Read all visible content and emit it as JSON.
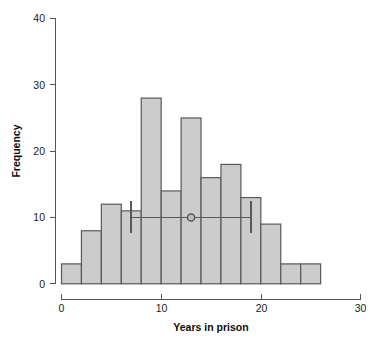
{
  "chart_data": {
    "type": "bar",
    "title": "",
    "subtitle": "",
    "xlabel": "Years in prison",
    "ylabel": "Frequency",
    "xlim": [
      0,
      30
    ],
    "ylim": [
      0,
      40
    ],
    "xticks": [
      0,
      10,
      20,
      30
    ],
    "xtick_labels": [
      "0",
      "10",
      "20",
      "30"
    ],
    "yticks": [
      0,
      10,
      20,
      30,
      40
    ],
    "ytick_labels": [
      "0",
      "10",
      "20",
      "30",
      "40"
    ],
    "grid": false,
    "legend": "none",
    "bin_width": 2,
    "bin_edges": [
      0,
      2,
      4,
      6,
      8,
      10,
      12,
      14,
      16,
      18,
      20,
      22,
      24,
      26
    ],
    "categories": [
      "0-2",
      "2-4",
      "4-6",
      "6-8",
      "8-10",
      "10-12",
      "12-14",
      "14-16",
      "16-18",
      "18-20",
      "20-22",
      "22-24",
      "24-26"
    ],
    "values": [
      3,
      8,
      12,
      11,
      28,
      14,
      25,
      16,
      18,
      13,
      9,
      3,
      3
    ],
    "bar_fill_color": "#cccccc",
    "bar_edge_color": "#595959",
    "annotations": {
      "interval_marker": {
        "type": "error-bar",
        "y": 10,
        "center": 13,
        "low": 7,
        "high": 19,
        "color": "#595959",
        "marker": "circle"
      }
    }
  },
  "axes": {
    "x_title": "Years in prison",
    "y_title": "Frequency"
  }
}
